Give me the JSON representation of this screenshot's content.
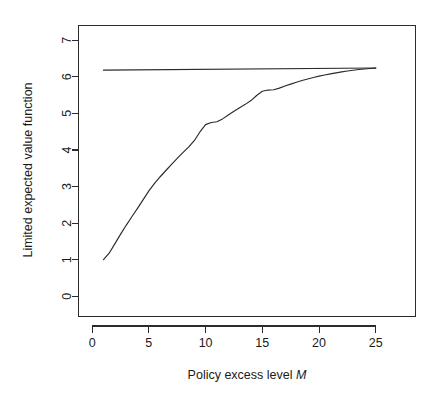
{
  "figure": {
    "background_color": "#ffffff",
    "line_color": "#2b2b2b",
    "text_color": "#1a1a1a"
  },
  "chart_data": {
    "type": "line",
    "title": "",
    "subtitle": "",
    "xlabel_prefix": "Policy excess level",
    "xlabel_symbol": "M",
    "xlabel": "Policy excess level M",
    "ylabel": "Limited expected value function",
    "xlim": [
      -1.2,
      28.5
    ],
    "ylim": [
      -0.55,
      7.4
    ],
    "xticks": [
      0,
      5,
      10,
      15,
      20,
      25
    ],
    "xtick_labels": [
      "0",
      "5",
      "10",
      "15",
      "20",
      "25"
    ],
    "yticks": [
      0,
      1,
      2,
      3,
      4,
      5,
      6,
      7
    ],
    "ytick_labels": [
      "0",
      "1",
      "2",
      "3",
      "4",
      "5",
      "6",
      "7"
    ],
    "grid": false,
    "legend": null,
    "legend_position": "none",
    "annotations": [],
    "series": [
      {
        "name": "Empirical limited expected value function",
        "style": "solid",
        "x": [
          1,
          1.5,
          2,
          2.5,
          3,
          3.5,
          4,
          4.5,
          5,
          5.5,
          6,
          6.5,
          7,
          7.5,
          8,
          8.5,
          9,
          9.5,
          10,
          10.5,
          11,
          11.5,
          12,
          12.5,
          13,
          13.5,
          14,
          14.5,
          15,
          15.5,
          16,
          16.5,
          17,
          17.5,
          18,
          18.5,
          19,
          19.5,
          20,
          20.5,
          21,
          21.5,
          22,
          22.5,
          23,
          23.5,
          24,
          24.5,
          25
        ],
        "y": [
          0.88,
          1.17,
          1.44,
          1.7,
          1.95,
          2.18,
          2.4,
          2.61,
          2.94,
          3.09,
          3.27,
          3.44,
          3.61,
          3.77,
          3.93,
          4.08,
          4.22,
          4.36,
          5.03,
          4.62,
          4.74,
          4.85,
          4.96,
          5.06,
          5.16,
          5.25,
          5.33,
          5.41,
          5.8,
          5.56,
          5.63,
          5.69,
          5.75,
          5.8,
          5.85,
          5.9,
          5.94,
          5.98,
          6.02,
          6.05,
          6.08,
          6.11,
          6.13,
          6.16,
          6.18,
          6.2,
          6.21,
          6.23,
          6.24
        ]
      },
      {
        "name": "Overall mean (horizontal reference line)",
        "style": "solid",
        "x": [
          1,
          25
        ],
        "y": [
          6.18,
          6.24
        ]
      }
    ]
  }
}
